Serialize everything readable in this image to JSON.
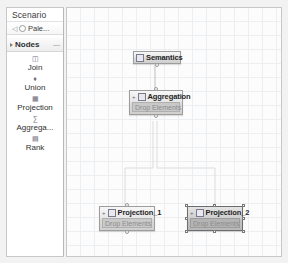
{
  "sidebar": {
    "title": "Scenario",
    "palette_row": {
      "back_icon": "back-arrow",
      "dot_icon": "palette-dot",
      "label": "Pale..."
    },
    "nodes_section": {
      "label": "Nodes",
      "expander_icon": "triangle-right",
      "collapse_icon": "collapse-marker"
    },
    "items": [
      {
        "label": "Join",
        "icon": "join-icon"
      },
      {
        "label": "Union",
        "icon": "union-icon"
      },
      {
        "label": "Projection",
        "icon": "projection-icon"
      },
      {
        "label": "Aggrega...",
        "icon": "aggregation-icon"
      },
      {
        "label": "Rank",
        "icon": "rank-icon"
      }
    ]
  },
  "canvas": {
    "grid": "14px",
    "nodes": [
      {
        "id": "semantics",
        "label": "Semantics",
        "icon": "semantics-icon",
        "selected": false,
        "drop_label": null
      },
      {
        "id": "aggregation",
        "label": "Aggregation",
        "icon": "aggregation-icon",
        "expander": "+",
        "selected": false,
        "drop_label": "Drop Elements"
      },
      {
        "id": "projection_1",
        "label": "Projection_1",
        "icon": "projection-icon",
        "expander": "+",
        "selected": false,
        "drop_label": "Drop Elements"
      },
      {
        "id": "projection_2",
        "label": "Projection_2",
        "icon": "projection-icon",
        "expander": "+",
        "selected": true,
        "drop_label": "Drop Elements"
      }
    ],
    "connections": [
      {
        "from": "semantics",
        "to": "aggregation"
      },
      {
        "from": "aggregation",
        "to": "projection_1"
      },
      {
        "from": "aggregation",
        "to": "projection_2"
      }
    ]
  },
  "colors": {
    "canvas_bg": "#fcfcfc",
    "grid_line": "#eceff2",
    "node_border": "#9d9d9d",
    "drop_zone": "#c9c9c9",
    "selected_node": "#c4c4c4"
  }
}
